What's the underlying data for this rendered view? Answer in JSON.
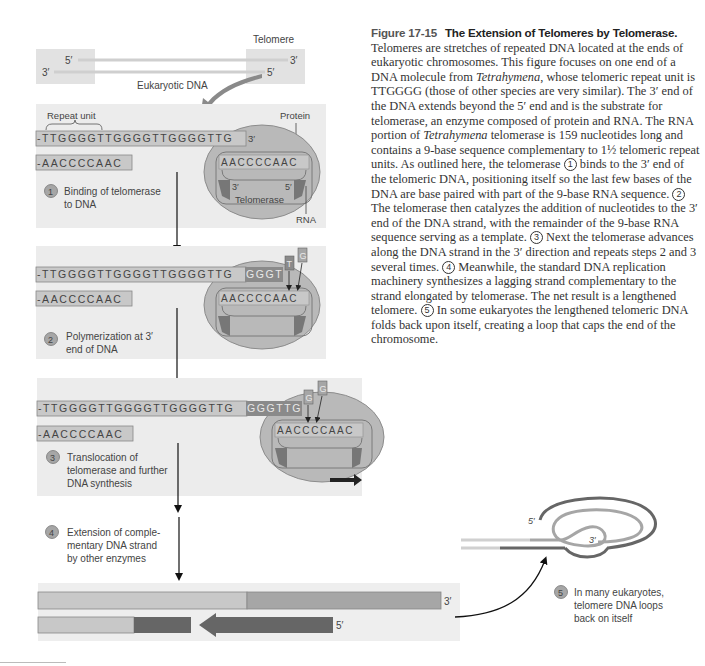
{
  "caption": {
    "figure_number": "Figure 17-15",
    "title": "The Extension of Telomeres by Telomerase.",
    "p1": "Telomeres are stretches of repeated DNA located at the ends of eukaryotic chromosomes. This figure focuses on one end of a DNA molecule from ",
    "species1": "Tetrahymena",
    "p2": ", whose telomeric repeat unit is TTGGGG (those of other species are very similar). The 3′ end of the DNA extends beyond the 5′ end and is the substrate for telomerase, an enzyme composed of protein and RNA. The RNA portion of ",
    "species2": "Tetrahymena",
    "p3": " telomerase is 159 nucleotides long and contains a 9-base sequence complementary to 1½ telomeric repeat units. As outlined here, the telomerase ",
    "c1": "1",
    "p4": " binds to the 3′ end of the telomeric DNA, positioning itself so the last few bases of the DNA are base paired with part of the 9-base RNA sequence. ",
    "c2": "2",
    "p5": " The telomerase then catalyzes the addition of nucleotides to the 3′ end of the DNA strand, with the remainder of the 9-base RNA sequence serving as a template. ",
    "c3": "3",
    "p6": " Next the telomerase advances along the DNA strand in the 3′ direction and repeats steps 2 and 3 several times. ",
    "c4": "4",
    "p7": " Meanwhile, the standard DNA replication machinery synthesizes a lagging strand complementary to the strand elongated by telomerase. The net result is a lengthened telomere. ",
    "c5": "5",
    "p8": " In some eukaryotes the lengthened telomeric DNA folds back upon itself, creating a loop that caps the end of the chromosome."
  },
  "overview": {
    "telomere_label": "Telomere",
    "dna_label": "Eukaryotic DNA",
    "left_top_end": "5′",
    "left_bottom_end": "3′",
    "right_top_end": "3′",
    "right_bottom_end": "5′"
  },
  "step1": {
    "repeat_unit_label": "Repeat unit",
    "protein_label": "Protein",
    "top_strand": "-TTGGGGTTGGGGTTGGGGTTG",
    "top_strand_end": "3′",
    "bottom_strand": "-AACCCCAAC",
    "rna_template": "AACCCCAAC",
    "rna_3": "3′",
    "rna_5": "5′",
    "enzyme_label": "Telomerase",
    "rna_label": "RNA",
    "number": "1",
    "desc_line1": "Binding of telomerase",
    "desc_line2": "to DNA"
  },
  "step2": {
    "top_strand": "-TTGGGGTTGGGGTTGGGGTTG",
    "new_bases": "GGGT",
    "incoming": [
      "T",
      "G"
    ],
    "bottom_strand": "-AACCCCAAC",
    "rna_template": "AACCCCAAC",
    "number": "2",
    "desc_line1": "Polymerization at 3′",
    "desc_line2": "end of DNA"
  },
  "step3": {
    "top_strand": "-TTGGGGTTGGGGTTGGGGTTG",
    "new_bases": "GGGTTG",
    "incoming": [
      "G",
      "G"
    ],
    "bottom_strand": "-AACCCCAAC",
    "rna_template": "AACCCCAAC",
    "number": "3",
    "desc_line1": "Translocation of",
    "desc_line2": "telomerase and further",
    "desc_line3": "DNA synthesis"
  },
  "step4": {
    "number": "4",
    "desc_line1": "Extension of comple-",
    "desc_line2": "mentary DNA strand",
    "desc_line3": "by other enzymes",
    "top_end": "3′",
    "bottom_end": "5′"
  },
  "step5": {
    "number": "5",
    "desc_line1": "In many eukaryotes,",
    "desc_line2": "telomere DNA loops",
    "desc_line3": "back on itself",
    "loop_5": "5′",
    "loop_3": "3′"
  },
  "colors": {
    "panel_bg": "#ececec",
    "strand_light": "#c8c8c8",
    "strand_mid": "#a6a6a6",
    "strand_dark": "#666666",
    "enzyme": "#b9b9b9",
    "enzyme_border": "#8c8c8c",
    "arrow_curve": "#8a8a8a"
  }
}
